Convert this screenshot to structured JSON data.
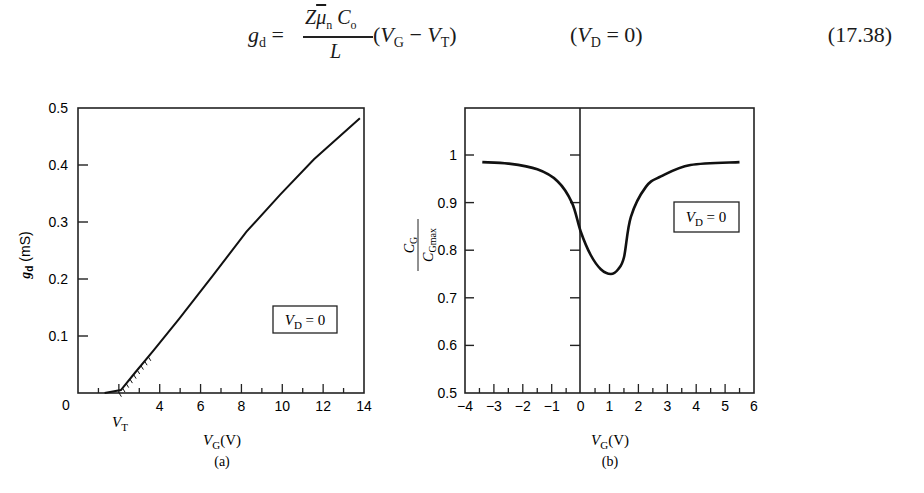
{
  "equation": {
    "lhs": "g",
    "lhs_sub": "d",
    "numerator_Z": "Z",
    "numerator_mu": "μ",
    "numerator_mu_sub": "n",
    "numerator_C": "C",
    "numerator_C_sub": "o",
    "denominator": "L",
    "factor_open": "(V",
    "factor_VG_sub": "G",
    "factor_minus": " − ",
    "factor_VT": "V",
    "factor_VT_sub": "T",
    "factor_close": ")",
    "condition_open": "(V",
    "condition_sub": "D",
    "condition_rest": " = 0)",
    "number": "(17.38)"
  },
  "chart_data": [
    {
      "id": "a",
      "type": "line",
      "caption": "(a)",
      "title": "",
      "xlabel": "V_G (V)",
      "ylabel": "g_d (mS)",
      "xlim": [
        0,
        14
      ],
      "ylim": [
        0,
        0.5
      ],
      "x_ticks": [
        "0",
        "V_T",
        "4",
        "6",
        "8",
        "10",
        "12",
        "14"
      ],
      "x_tick_values": [
        0,
        2,
        4,
        6,
        8,
        10,
        12,
        14
      ],
      "y_ticks": [
        "0.1",
        "0.2",
        "0.3",
        "0.4",
        "0.5"
      ],
      "y_tick_values": [
        0.1,
        0.2,
        0.3,
        0.4,
        0.5
      ],
      "annotation": "V_D = 0",
      "grid": false,
      "series": [
        {
          "name": "g_d",
          "x": [
            1.3,
            2.1,
            2.8,
            3.7,
            4.95,
            6.6,
            8.25,
            9.9,
            11.55,
            13.8
          ],
          "y": [
            0.0,
            0.005,
            0.036,
            0.075,
            0.13,
            0.206,
            0.283,
            0.348,
            0.41,
            0.482
          ]
        }
      ]
    },
    {
      "id": "b",
      "type": "line",
      "caption": "(b)",
      "title": "",
      "xlabel": "V_G (V)",
      "ylabel": "C_G / C_Gmax",
      "xlim": [
        -4,
        6
      ],
      "ylim": [
        0.5,
        1.1
      ],
      "x_ticks": [
        "−4",
        "−3",
        "−2",
        "−1",
        "0",
        "1",
        "2",
        "3",
        "4",
        "5",
        "6"
      ],
      "x_tick_values": [
        -4,
        -3,
        -2,
        -1,
        0,
        1,
        2,
        3,
        4,
        5,
        6
      ],
      "y_ticks": [
        "0.5",
        "0.6",
        "0.7",
        "0.8",
        "0.9",
        "1"
      ],
      "y_tick_values": [
        0.5,
        0.6,
        0.7,
        0.8,
        0.9,
        1.0
      ],
      "annotation": "V_D = 0",
      "grid": false,
      "series": [
        {
          "name": "C_G/C_Gmax",
          "x": [
            -3.4,
            -2.5,
            -1.5,
            -0.8,
            -0.3,
            0.0,
            0.35,
            0.7,
            1.05,
            1.3,
            1.5,
            1.74,
            2.26,
            2.78,
            3.8,
            5.5
          ],
          "y": [
            0.985,
            0.982,
            0.97,
            0.945,
            0.9,
            0.84,
            0.79,
            0.76,
            0.75,
            0.76,
            0.785,
            0.87,
            0.933,
            0.955,
            0.979,
            0.985
          ]
        }
      ]
    }
  ],
  "figures": {
    "a": {
      "caption": "(a)",
      "ylabel_main": "g",
      "ylabel_sub": "d",
      "ylabel_unit": " (mS)",
      "xlabel_main": "V",
      "xlabel_sub": "G",
      "xlabel_unit": "(V)",
      "vt_label": "V",
      "vt_sub": "T",
      "zero_label": "0",
      "box_main": "V",
      "box_sub": "D",
      "box_rest": " = 0",
      "x_tick_labels": [
        "4",
        "6",
        "8",
        "10",
        "12",
        "14"
      ],
      "y_tick_labels": [
        "0.1",
        "0.2",
        "0.3",
        "0.4",
        "0.5"
      ]
    },
    "b": {
      "caption": "(b)",
      "ylabel_num": "C",
      "ylabel_num_sub": "G",
      "ylabel_den": "C",
      "ylabel_den_sub": "Gmax",
      "xlabel_main": "V",
      "xlabel_sub": "G",
      "xlabel_unit": "(V)",
      "box_main": "V",
      "box_sub": "D",
      "box_rest": " = 0",
      "x_tick_labels": [
        "−4",
        "−3",
        "−2",
        "−1",
        "0",
        "1",
        "2",
        "3",
        "4",
        "5",
        "6"
      ],
      "y_tick_labels": [
        "0.5",
        "0.6",
        "0.7",
        "0.8",
        "0.9",
        "1"
      ]
    }
  }
}
